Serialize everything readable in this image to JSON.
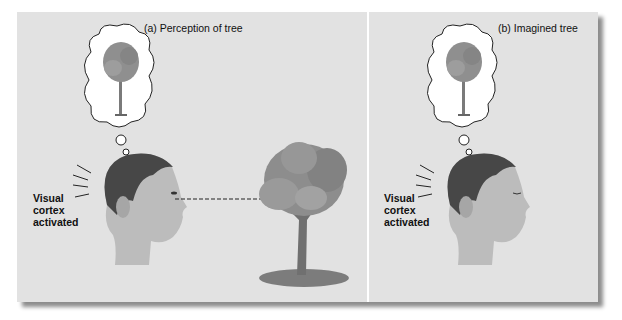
{
  "figure": {
    "panels": [
      {
        "id": "a",
        "caption": "(a) Perception of tree",
        "label_lines": [
          "Visual",
          "cortex",
          "activated"
        ],
        "has_real_tree": true,
        "has_gaze_line": true
      },
      {
        "id": "b",
        "caption": "(b) Imagined tree",
        "label_lines": [
          "Visual",
          "cortex",
          "activated"
        ],
        "has_real_tree": false,
        "has_gaze_line": false
      }
    ],
    "colors": {
      "panel_bg": "#e2e2e2",
      "divider": "#ffffff",
      "text": "#111111",
      "foliage": "#8c8c8c",
      "trunk": "#6e6e6e",
      "skin": "#bdbdbd",
      "hair": "#444444"
    }
  }
}
